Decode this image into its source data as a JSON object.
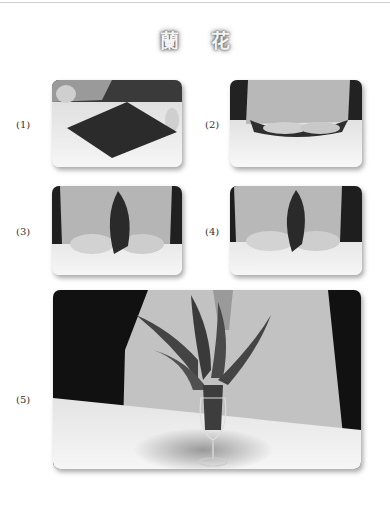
{
  "title": {
    "char1": "蘭",
    "char2": "花"
  },
  "steps": [
    {
      "label": "(1)",
      "image": "napkin-laid-flat-diamond"
    },
    {
      "label": "(2)",
      "image": "napkin-folded-hands"
    },
    {
      "label": "(3)",
      "image": "napkin-gathered-upright"
    },
    {
      "label": "(4)",
      "image": "napkin-pinched-upright"
    },
    {
      "label": "(5)",
      "image": "orchid-napkin-in-wineglass"
    }
  ]
}
